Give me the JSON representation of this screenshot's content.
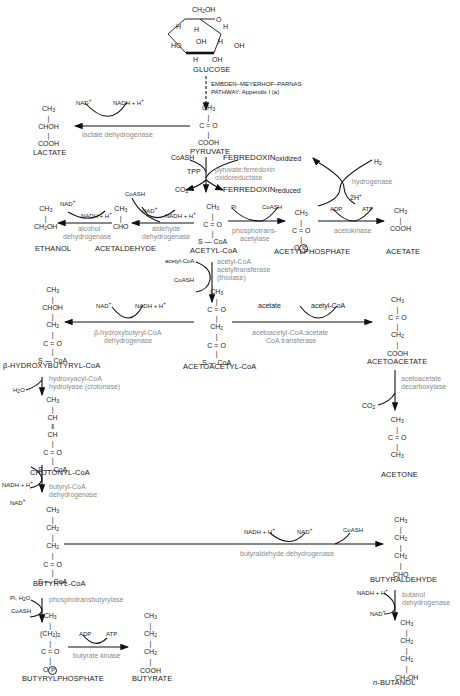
{
  "compounds": {
    "glucose": {
      "label": "GLUCOSE",
      "structure": [
        "CH2OH",
        "O",
        "H",
        "H",
        "OH",
        "HO",
        "OH",
        "H",
        "H",
        "OH"
      ]
    },
    "pyruvate": {
      "label": "PYRUVATE",
      "lines": [
        "CH3",
        "C=O",
        "COOH"
      ]
    },
    "lactate": {
      "label": "LACTATE",
      "lines": [
        "CH3",
        "CHOH",
        "COOH"
      ]
    },
    "acetyl_coa": {
      "label": "ACETYL-CoA",
      "lines": [
        "CH3",
        "C=O",
        "S—CoA"
      ]
    },
    "acetylphosphate": {
      "label": "ACETYLPHOSPHATE",
      "lines": [
        "CH3",
        "C=O",
        "O(P)"
      ]
    },
    "acetate": {
      "label": "ACETATE",
      "lines": [
        "CH3",
        "COOH"
      ]
    },
    "acetaldehyde": {
      "label": "ACETALDEHYDE",
      "lines": [
        "CH3",
        "CHO"
      ]
    },
    "ethanol": {
      "label": "ETHANOL",
      "lines": [
        "CH3",
        "CH2OH"
      ]
    },
    "acetoacetyl_coa": {
      "label": "ACETOACETYL-CoA",
      "lines": [
        "CH3",
        "C=O",
        "CH2",
        "C=O",
        "S—CoA"
      ]
    },
    "acetoacetate": {
      "label": "ACETOACETATE",
      "lines": [
        "CH3",
        "C=O",
        "CH2",
        "COOH"
      ]
    },
    "acetone": {
      "label": "ACETONE",
      "lines": [
        "CH3",
        "C=O",
        "CH3"
      ]
    },
    "b_hydroxybutyryl_coa": {
      "label": "β-HYDROXYBUTYRYL-CoA",
      "lines": [
        "CH3",
        "CHOH",
        "CH2",
        "C=O",
        "S—CoA"
      ]
    },
    "crotonyl_coa": {
      "label": "CROTONYL-CoA",
      "lines": [
        "CH3",
        "CH",
        "CH",
        "C=O",
        "S—CoA"
      ]
    },
    "butyryl_coa": {
      "label": "BUTYRYL-CoA",
      "lines": [
        "CH3",
        "CH2",
        "CH2",
        "C=O",
        "S—CoA"
      ]
    },
    "butyrylphosphate": {
      "label": "BUTYRYLPHOSPHATE",
      "lines": [
        "CH3",
        "(CH2)2",
        "C=O",
        "O(P)"
      ]
    },
    "butyrate": {
      "label": "BUTYRATE",
      "lines": [
        "CH3",
        "CH2",
        "CH2",
        "COOH"
      ]
    },
    "butyraldehyde": {
      "label": "BUTYRALDEHYDE",
      "lines": [
        "CH3",
        "CH2",
        "CH2",
        "CHO"
      ]
    },
    "n_butanol": {
      "label": "n-BUTANOL",
      "lines": [
        "CH3",
        "CH2",
        "CH2",
        "CH2OH"
      ]
    }
  },
  "pathways": {
    "emp": {
      "line1": "EMBDEN–MEYERHOF–PARNAS",
      "line2": "PATHWAY: Appendix I (a)"
    }
  },
  "enzymes": {
    "lactate_dh": "lactate dehydrogenase",
    "pfor_1": "pyruvate:ferredoxin",
    "pfor_2": "oxidoreductase",
    "hydrogenase": "hydrogenase",
    "pta_1": "phosphotrans-",
    "pta_2": "acetylase",
    "acetokinase": "acetokinase",
    "alcohol_dh_1": "alcohol",
    "alcohol_dh_2": "dehydrogenase",
    "aldehyde_dh_1": "aldehyde",
    "aldehyde_dh_2": "dehydrogenase",
    "thiolase_1": "acetyl-CoA",
    "thiolase_2": "acetyltransferase",
    "thiolase_3": "(thiolase)",
    "hbd_1": "β-hydroxybutyryl-CoA",
    "hbd_2": "dehydrogenase",
    "ctfab_1": "acetoacetyl-CoA:acetate",
    "ctfab_2": "CoA transferase",
    "adc_1": "acetoacetate",
    "adc_2": "decarboxylase",
    "crt_1": "hydroxyacyl-CoA",
    "crt_2": "hydrolyase (crotonase)",
    "bcd_1": "butyryl-CoA",
    "bcd_2": "dehydrogenase",
    "bad": "butyraldehyde dehydrogenase",
    "bdh_1": "butanol",
    "bdh_2": "dehydrogenase",
    "ptb": "phosphotransbutyrylase",
    "buk": "butyrate kinase"
  },
  "cofactors": {
    "nad_plus": "NAD+",
    "nadh": "NADH + H+",
    "coash": "CoASH",
    "ferredoxin_ox": "FERREDOXIN",
    "ferredoxin_ox_sub": "oxidized",
    "ferredoxin_red": "FERREDOXIN",
    "ferredoxin_red_sub": "reduced",
    "tpp": "TPP",
    "co2": "CO2",
    "h2": "H2",
    "two_h": "2H+",
    "pi": "Pi",
    "adp": "ADP",
    "atp": "ATP",
    "acetyl_coa": "acetyl-CoA",
    "acetate": "acetate",
    "h2o": "H2O",
    "pi_h2o": "Pi, H2O"
  }
}
